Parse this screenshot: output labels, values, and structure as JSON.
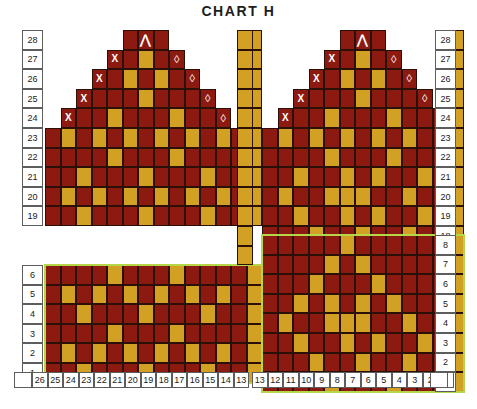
{
  "title": "CHART H",
  "colors": {
    "main": "#8d1a10",
    "contrast": "#d2a123",
    "grid": "#2b1008",
    "outline": "#b5d648",
    "label_border": "#5d5d5d",
    "background": "#ffffff",
    "symbol": "#ffffff",
    "title": "#1d1d1d"
  },
  "legend": {
    "symbols": [
      {
        "name": "decrease-left",
        "glyph": "X"
      },
      {
        "name": "decrease-right",
        "glyph": "◊"
      },
      {
        "name": "double-decrease",
        "glyph": "⋀"
      }
    ]
  },
  "axes": {
    "column_labels_left": [
      26,
      25,
      24,
      23,
      22,
      21,
      20,
      19,
      18,
      17,
      16,
      15,
      14,
      13
    ],
    "column_labels_right": [
      13,
      12,
      11,
      10,
      9,
      8,
      7,
      6,
      5,
      4,
      3,
      2,
      1
    ],
    "row_labels_left_top": [
      28,
      27,
      26,
      25,
      24,
      23,
      22,
      21,
      20,
      19
    ],
    "row_labels_left_bottom": [
      6,
      5,
      4,
      3,
      2,
      1
    ],
    "row_labels_right_top": [
      28,
      27,
      26,
      25,
      24,
      23,
      22,
      21,
      20,
      19,
      18,
      17
    ],
    "row_labels_right_bottom": [
      8,
      7,
      6,
      5,
      4,
      3,
      2,
      1
    ]
  },
  "chart_data": {
    "type": "heatmap",
    "title": "CHART H",
    "xlabel": "",
    "ylabel": "",
    "grid": true,
    "legend_position": "none",
    "value_map": {
      "0": "empty",
      "1": "main",
      "2": "contrast"
    },
    "panels": [
      {
        "name": "left-top",
        "x": 45,
        "y": 30,
        "cols": 14,
        "rows": 10,
        "row_from": 28,
        "row_to": 19,
        "col_from": 26,
        "col_to": 13,
        "outline": false,
        "rows_data": [
          [
            0,
            0,
            0,
            0,
            0,
            1,
            1,
            1,
            0,
            0,
            0,
            0,
            0,
            2
          ],
          [
            0,
            0,
            0,
            0,
            1,
            1,
            2,
            1,
            1,
            0,
            0,
            0,
            0,
            2
          ],
          [
            0,
            0,
            0,
            1,
            1,
            2,
            1,
            2,
            1,
            1,
            0,
            0,
            0,
            2
          ],
          [
            0,
            0,
            1,
            1,
            1,
            1,
            2,
            1,
            1,
            1,
            1,
            0,
            0,
            2
          ],
          [
            0,
            1,
            1,
            1,
            2,
            1,
            1,
            1,
            2,
            1,
            1,
            1,
            0,
            2
          ],
          [
            1,
            2,
            1,
            2,
            1,
            2,
            1,
            2,
            1,
            2,
            1,
            2,
            1,
            2
          ],
          [
            1,
            1,
            1,
            1,
            2,
            1,
            1,
            1,
            2,
            1,
            1,
            1,
            1,
            2
          ],
          [
            1,
            1,
            2,
            1,
            1,
            1,
            2,
            1,
            1,
            1,
            2,
            1,
            1,
            2
          ],
          [
            1,
            2,
            1,
            2,
            1,
            2,
            1,
            2,
            1,
            2,
            1,
            2,
            1,
            2
          ],
          [
            1,
            1,
            2,
            1,
            1,
            1,
            2,
            1,
            1,
            1,
            2,
            1,
            1,
            2
          ]
        ],
        "symbols": [
          {
            "row": 0,
            "col": 6,
            "glyph": "⋀",
            "kind": "arrow"
          },
          {
            "row": 1,
            "col": 4,
            "glyph": "X",
            "kind": "x"
          },
          {
            "row": 1,
            "col": 8,
            "glyph": "◊",
            "kind": "diamond"
          },
          {
            "row": 2,
            "col": 3,
            "glyph": "X",
            "kind": "x"
          },
          {
            "row": 2,
            "col": 9,
            "glyph": "◊",
            "kind": "diamond"
          },
          {
            "row": 3,
            "col": 2,
            "glyph": "X",
            "kind": "x"
          },
          {
            "row": 3,
            "col": 10,
            "glyph": "◊",
            "kind": "diamond"
          },
          {
            "row": 4,
            "col": 1,
            "glyph": "X",
            "kind": "x"
          },
          {
            "row": 4,
            "col": 11,
            "glyph": "◊",
            "kind": "diamond"
          }
        ]
      },
      {
        "name": "left-bottom",
        "x": 45,
        "y": 265,
        "cols": 14,
        "rows": 6,
        "row_from": 6,
        "row_to": 1,
        "col_from": 26,
        "col_to": 13,
        "outline": true,
        "rows_data": [
          [
            1,
            1,
            1,
            1,
            2,
            1,
            1,
            1,
            2,
            1,
            1,
            1,
            1,
            2
          ],
          [
            1,
            2,
            1,
            2,
            1,
            2,
            1,
            2,
            1,
            2,
            1,
            2,
            1,
            2
          ],
          [
            1,
            1,
            2,
            1,
            1,
            1,
            2,
            1,
            1,
            1,
            2,
            1,
            1,
            2
          ],
          [
            1,
            1,
            1,
            1,
            2,
            1,
            1,
            1,
            2,
            1,
            1,
            1,
            1,
            2
          ],
          [
            1,
            2,
            1,
            2,
            1,
            2,
            1,
            2,
            1,
            2,
            1,
            2,
            1,
            2
          ],
          [
            1,
            1,
            2,
            1,
            1,
            1,
            2,
            1,
            1,
            1,
            2,
            1,
            1,
            2
          ]
        ],
        "symbols": []
      },
      {
        "name": "right-top",
        "x": 262,
        "y": 30,
        "cols": 13,
        "rows": 12,
        "row_from": 28,
        "row_to": 17,
        "col_from": 13,
        "col_to": 1,
        "outline": false,
        "rows_data": [
          [
            0,
            0,
            0,
            0,
            0,
            1,
            1,
            1,
            0,
            0,
            0,
            0,
            2
          ],
          [
            0,
            0,
            0,
            0,
            1,
            1,
            2,
            1,
            1,
            0,
            0,
            0,
            2
          ],
          [
            0,
            0,
            0,
            1,
            1,
            2,
            1,
            2,
            1,
            1,
            0,
            0,
            2
          ],
          [
            0,
            0,
            1,
            1,
            1,
            1,
            2,
            1,
            1,
            1,
            1,
            0,
            2
          ],
          [
            0,
            1,
            1,
            1,
            2,
            1,
            1,
            1,
            2,
            1,
            1,
            1,
            2
          ],
          [
            1,
            2,
            1,
            2,
            1,
            2,
            1,
            2,
            1,
            2,
            1,
            1,
            2
          ],
          [
            1,
            1,
            1,
            1,
            2,
            1,
            1,
            1,
            2,
            1,
            1,
            1,
            2
          ],
          [
            1,
            1,
            2,
            1,
            1,
            2,
            1,
            2,
            1,
            1,
            2,
            1,
            2
          ],
          [
            1,
            2,
            1,
            1,
            2,
            2,
            2,
            1,
            1,
            2,
            1,
            1,
            2
          ],
          [
            1,
            1,
            2,
            1,
            1,
            2,
            1,
            2,
            1,
            1,
            2,
            1,
            2
          ],
          [
            1,
            1,
            1,
            2,
            1,
            1,
            2,
            1,
            1,
            2,
            1,
            1,
            2
          ],
          [
            1,
            1,
            1,
            1,
            2,
            1,
            1,
            1,
            2,
            1,
            1,
            1,
            2
          ]
        ],
        "symbols": [
          {
            "row": 0,
            "col": 6,
            "glyph": "⋀",
            "kind": "arrow"
          },
          {
            "row": 1,
            "col": 4,
            "glyph": "X",
            "kind": "x"
          },
          {
            "row": 1,
            "col": 8,
            "glyph": "◊",
            "kind": "diamond"
          },
          {
            "row": 2,
            "col": 3,
            "glyph": "X",
            "kind": "x"
          },
          {
            "row": 2,
            "col": 9,
            "glyph": "◊",
            "kind": "diamond"
          },
          {
            "row": 3,
            "col": 2,
            "glyph": "X",
            "kind": "x"
          },
          {
            "row": 3,
            "col": 10,
            "glyph": "◊",
            "kind": "diamond"
          },
          {
            "row": 4,
            "col": 1,
            "glyph": "X",
            "kind": "x"
          },
          {
            "row": 4,
            "col": 11,
            "glyph": "◊",
            "kind": "diamond"
          }
        ]
      },
      {
        "name": "right-bottom",
        "x": 262,
        "y": 235,
        "cols": 13,
        "rows": 8,
        "row_from": 8,
        "row_to": 1,
        "col_from": 13,
        "col_to": 1,
        "outline": true,
        "rows_data": [
          [
            1,
            1,
            1,
            1,
            1,
            2,
            1,
            1,
            1,
            1,
            1,
            1,
            2
          ],
          [
            1,
            1,
            1,
            1,
            2,
            1,
            2,
            1,
            1,
            1,
            1,
            1,
            2
          ],
          [
            1,
            1,
            1,
            2,
            1,
            1,
            1,
            2,
            1,
            1,
            1,
            1,
            2
          ],
          [
            1,
            1,
            2,
            1,
            2,
            1,
            2,
            1,
            2,
            1,
            1,
            1,
            2
          ],
          [
            1,
            2,
            1,
            1,
            2,
            2,
            2,
            1,
            1,
            2,
            1,
            1,
            2
          ],
          [
            1,
            1,
            2,
            1,
            1,
            2,
            1,
            2,
            1,
            1,
            2,
            1,
            2
          ],
          [
            1,
            1,
            1,
            2,
            1,
            1,
            2,
            1,
            1,
            2,
            1,
            1,
            2
          ],
          [
            1,
            1,
            1,
            1,
            2,
            1,
            1,
            1,
            2,
            1,
            1,
            1,
            2
          ]
        ],
        "symbols": []
      },
      {
        "name": "center-gold-column",
        "x": 237,
        "y": 30,
        "cols": 1,
        "rows": 12,
        "row_from": 28,
        "row_to": 17,
        "col_from": 13,
        "col_to": 13,
        "outline": false,
        "rows_data": [
          [
            2
          ],
          [
            2
          ],
          [
            2
          ],
          [
            2
          ],
          [
            2
          ],
          [
            2
          ],
          [
            2
          ],
          [
            2
          ],
          [
            2
          ],
          [
            2
          ],
          [
            2
          ],
          [
            2
          ]
        ],
        "symbols": []
      }
    ]
  }
}
